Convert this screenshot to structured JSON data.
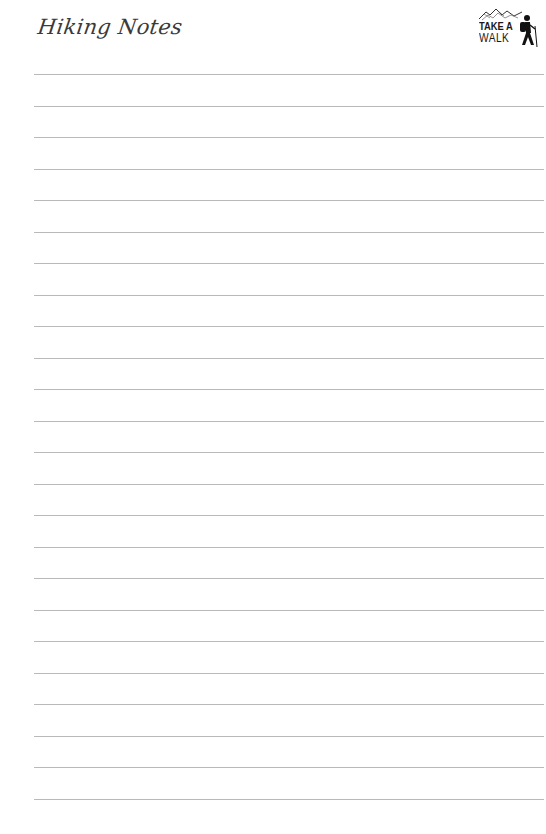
{
  "header": {
    "title": "Hiking Notes",
    "logo": {
      "line1": "TAKE A",
      "line2": "WALK",
      "icon": "hiker-mountains-icon"
    }
  },
  "page": {
    "ruled_lines": 24,
    "first_line_y": 74,
    "line_spacing": 31.5,
    "line_color": "#b9b9b9",
    "title_color": "#3a3a3a"
  }
}
